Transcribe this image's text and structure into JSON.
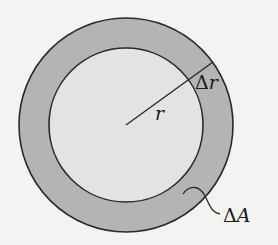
{
  "diagram": {
    "labels": {
      "radius": "r",
      "delta_r_symbol": "Δ",
      "delta_r_var": "r",
      "delta_a_symbol": "Δ",
      "delta_a_var": "A"
    },
    "colors": {
      "background": "#f3f3f1",
      "ring_fill": "#b4b4b2",
      "inner_fill": "#e3e3e1",
      "stroke": "#2a2a2a"
    },
    "geometry": {
      "center": [
        126,
        125
      ],
      "outer_radius": 107,
      "inner_radius": 77
    }
  }
}
